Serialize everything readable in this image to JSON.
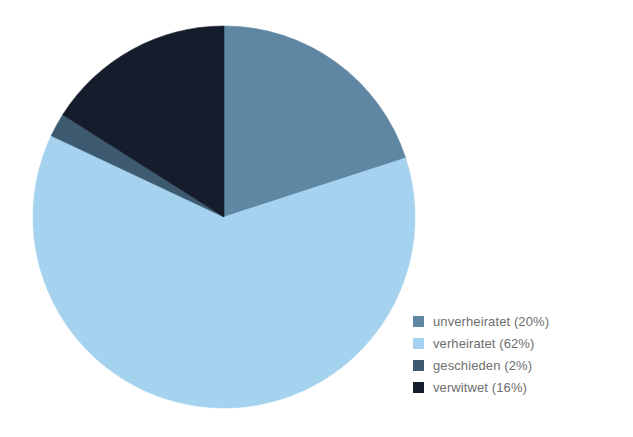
{
  "chart_data": {
    "type": "pie",
    "title": "",
    "subtitle": "",
    "xlabel": "",
    "ylabel": "",
    "categories": [
      "unverheiratet",
      "verheiratet",
      "geschieden",
      "verwitwet"
    ],
    "values": [
      20,
      62,
      2,
      16
    ],
    "value_unit": "%",
    "start_angle_deg": 0,
    "direction": "clockwise",
    "grid": false,
    "legend_position": "right",
    "slices": [
      {
        "label": "unverheiratet",
        "value": 20,
        "color": "#5f87a3",
        "legend_text": "unverheiratet (20%)"
      },
      {
        "label": "verheiratet",
        "value": 62,
        "color": "#a5d2ee",
        "legend_text": "verheiratet (62%)"
      },
      {
        "label": "geschieden",
        "value": 2,
        "color": "#3d5a70",
        "legend_text": "geschieden (2%)"
      },
      {
        "label": "verwitwet",
        "value": 16,
        "color": "#151c2b",
        "legend_text": "verwitwet (16%)"
      }
    ],
    "geometry": {
      "cx": 224,
      "cy": 217,
      "r": 191
    },
    "background": "#ffffff",
    "legend_text_color": "#6e6e6e"
  },
  "legend": {
    "items": [
      {
        "label": "unverheiratet (20%)"
      },
      {
        "label": "verheiratet (62%)"
      },
      {
        "label": "geschieden (2%)"
      },
      {
        "label": "verwitwet (16%)"
      }
    ]
  }
}
